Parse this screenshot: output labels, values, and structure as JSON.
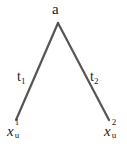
{
  "diagram": {
    "type": "tree",
    "root": {
      "label": "a"
    },
    "edges": [
      {
        "label_base": "t",
        "label_sub": "1",
        "from": "a",
        "to": "x_u^1"
      },
      {
        "label_base": "t",
        "label_sub": "2",
        "from": "a",
        "to": "x_u^2"
      }
    ],
    "leaves": [
      {
        "base": "x",
        "sub": "u",
        "sup": "1"
      },
      {
        "base": "x",
        "sub": "u",
        "sup": "2"
      }
    ],
    "colors": {
      "edge": "#555555",
      "text": "#222222",
      "background": "#ffffff"
    }
  }
}
